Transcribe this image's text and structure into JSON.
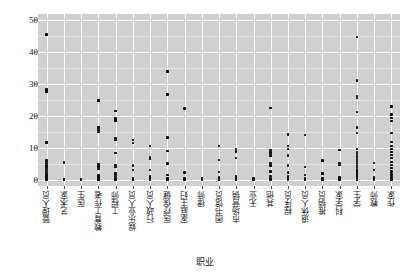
{
  "chart_data": {
    "type": "scatter",
    "title": "",
    "xlabel": "职业",
    "ylabel": "权重",
    "ylim": [
      -2,
      52
    ],
    "yticks": [
      0,
      10,
      20,
      30,
      40,
      50
    ],
    "grid": true,
    "legend": "none",
    "marker": "square",
    "marker_color": "#111111",
    "panel_background": "#d0d0d0",
    "gridline_color": "#ffffff",
    "categories": [
      "管理人员",
      "艺术家",
      "医生",
      "教育工作者",
      "工程师",
      "娱乐业人员",
      "行政人员",
      "医疗保健",
      "家庭主妇",
      "律师",
      "图书馆员",
      "市场营销",
      "无业",
      "其他",
      "程序员",
      "退休人员",
      "推销员",
      "科学家",
      "学生",
      "教师",
      "作家"
    ],
    "series": [
      {
        "name": "权重",
        "points": [
          {
            "category": "管理人员",
            "values": [
              45.5,
              28.3,
              27.6,
              11.7,
              6.0,
              5.2,
              4.6,
              4.1,
              3.6,
              3.0,
              2.4,
              1.6,
              1.0,
              0.5,
              0.2,
              0.0
            ]
          },
          {
            "category": "艺术家",
            "values": [
              5.4,
              0.2,
              0.0
            ]
          },
          {
            "category": "医生",
            "values": [
              0.2,
              0.0
            ]
          },
          {
            "category": "教育工作者",
            "values": [
              24.8,
              16.4,
              15.6,
              15.0,
              4.7,
              4.2,
              3.4,
              1.3,
              0.6,
              0.2,
              0.0
            ]
          },
          {
            "category": "工程师",
            "values": [
              21.6,
              19.2,
              18.6,
              13.1,
              12.4,
              8.4,
              4.6,
              3.9,
              2.0,
              1.1,
              0.5,
              0.2,
              0.0
            ]
          },
          {
            "category": "娱乐业人员",
            "values": [
              12.4,
              11.5,
              4.5,
              3.0,
              0.4,
              0.0
            ]
          },
          {
            "category": "行政人员",
            "values": [
              10.5,
              7.0,
              6.5,
              3.0,
              1.0,
              0.3,
              0.0
            ]
          },
          {
            "category": "医疗保健",
            "values": [
              34.0,
              26.8,
              13.3,
              9.0,
              5.0,
              1.5,
              0.4,
              0.0
            ]
          },
          {
            "category": "家庭主妇",
            "values": [
              22.4,
              2.2,
              0.5,
              0.0
            ]
          },
          {
            "category": "律师",
            "values": [
              0.4,
              0.0
            ]
          },
          {
            "category": "图书馆员",
            "values": [
              10.6,
              6.2,
              2.4,
              0.6,
              0.2,
              0.0
            ]
          },
          {
            "category": "市场营销",
            "values": [
              9.6,
              8.8,
              6.8,
              1.0,
              0.3,
              0.0
            ]
          },
          {
            "category": "无业",
            "values": [
              0.3,
              0.0
            ]
          },
          {
            "category": "其他",
            "values": [
              22.5,
              9.3,
              8.5,
              7.6,
              5.2,
              4.4,
              2.6,
              1.2,
              0.4,
              0.0
            ]
          },
          {
            "category": "程序员",
            "values": [
              14.2,
              10.6,
              9.6,
              7.6,
              4.4,
              2.2,
              1.0,
              0.3,
              0.0
            ]
          },
          {
            "category": "退休人员",
            "values": [
              14.0,
              4.0,
              1.4,
              0.5,
              0.0
            ]
          },
          {
            "category": "推销员",
            "values": [
              6.0,
              2.0,
              0.4,
              0.0
            ]
          },
          {
            "category": "科学家",
            "values": [
              9.3,
              5.2,
              4.6,
              0.6,
              0.2,
              0.0
            ]
          },
          {
            "category": "学生",
            "values": [
              44.8,
              31.2,
              26.3,
              25.6,
              21.2,
              16.4,
              14.6,
              9.6,
              8.6,
              8.0,
              7.2,
              6.4,
              5.8,
              5.2,
              4.6,
              4.0,
              3.4,
              2.8,
              2.2,
              1.6,
              1.0,
              0.6,
              0.2,
              0.0
            ]
          },
          {
            "category": "教师",
            "values": [
              5.2,
              3.0,
              0.6,
              0.0
            ]
          },
          {
            "category": "作家",
            "values": [
              23.0,
              20.4,
              19.3,
              18.4,
              14.6,
              11.8,
              10.6,
              9.6,
              8.6,
              7.8,
              6.8,
              5.6,
              4.6,
              3.6,
              2.6,
              1.6,
              0.8,
              0.2,
              0.0
            ]
          }
        ]
      }
    ]
  },
  "axes": {
    "y_label": "权重",
    "x_label": "职业",
    "y_tick_labels": [
      "0",
      "10",
      "20",
      "30",
      "40",
      "50"
    ]
  }
}
